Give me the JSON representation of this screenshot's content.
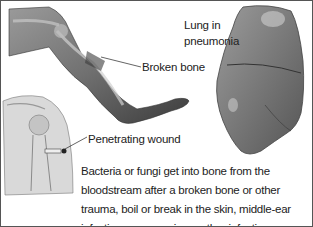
{
  "figure": {
    "labels": {
      "broken_bone": "Broken bone",
      "lung": "Lung in pneumonia",
      "lung_line1": "Lung in",
      "lung_line2": "pneumonia",
      "penetrating_wound": "Penetrating wound"
    },
    "caption": "Bacteria or fungi get into bone from the bloodstream after a broken bone or other trauma, boil or break in the skin, middle-ear infection, pneumonia, or other infections.",
    "illustrations": [
      "leg-with-broken-bone",
      "lung-in-pneumonia",
      "shoulder-with-penetrating-wound"
    ],
    "colors": {
      "border": "#555555",
      "text": "#222222",
      "illustration": "#6e6e6e"
    }
  }
}
